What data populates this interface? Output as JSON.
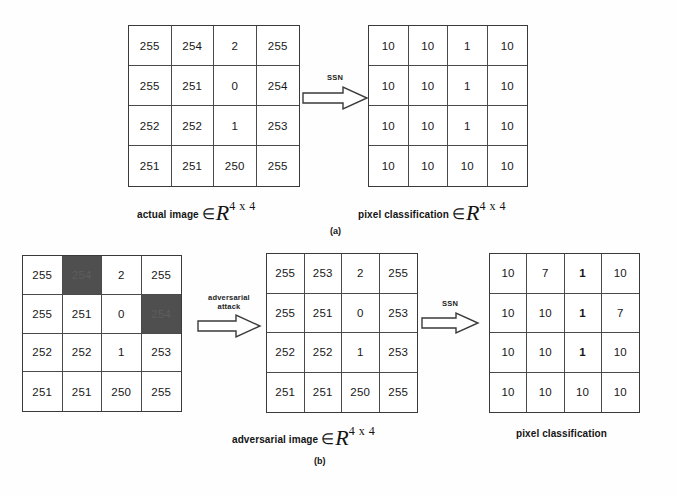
{
  "figure": {
    "panels": [
      {
        "id": "a",
        "label": "(a)",
        "left_matrix": {
          "name": "actual image",
          "rows": [
            [
              "255",
              "254",
              "2",
              "255"
            ],
            [
              "255",
              "251",
              "0",
              "254"
            ],
            [
              "252",
              "252",
              "1",
              "253"
            ],
            [
              "251",
              "251",
              "250",
              "255"
            ]
          ],
          "shaded": []
        },
        "right_matrix": {
          "name": "pixel classification",
          "rows": [
            [
              "10",
              "10",
              "1",
              "10"
            ],
            [
              "10",
              "10",
              "1",
              "10"
            ],
            [
              "10",
              "10",
              "1",
              "10"
            ],
            [
              "10",
              "10",
              "10",
              "10"
            ]
          ],
          "shaded": []
        },
        "arrow": {
          "label": "SSN"
        },
        "left_caption": {
          "text": "actual image",
          "member": "∈",
          "symbol": "R",
          "superscript": "4 x 4"
        },
        "right_caption": {
          "text": "pixel classification",
          "member": "∈",
          "symbol": "R",
          "superscript": "4 x 4"
        }
      },
      {
        "id": "b",
        "label": "(b)",
        "left_matrix": {
          "name": "original image with perturbed pixels",
          "rows": [
            [
              "255",
              "254",
              "2",
              "255"
            ],
            [
              "255",
              "251",
              "0",
              "254"
            ],
            [
              "252",
              "252",
              "1",
              "253"
            ],
            [
              "251",
              "251",
              "250",
              "255"
            ]
          ],
          "shaded": [
            "0,1",
            "1,3"
          ]
        },
        "middle_matrix": {
          "name": "adversarial image",
          "rows": [
            [
              "255",
              "253",
              "2",
              "255"
            ],
            [
              "255",
              "251",
              "0",
              "253"
            ],
            [
              "252",
              "252",
              "1",
              "253"
            ],
            [
              "251",
              "251",
              "250",
              "255"
            ]
          ],
          "shaded": []
        },
        "right_matrix": {
          "name": "pixel classification",
          "rows": [
            [
              "10",
              "7",
              "1",
              "10"
            ],
            [
              "10",
              "10",
              "1",
              "7"
            ],
            [
              "10",
              "10",
              "1",
              "10"
            ],
            [
              "10",
              "10",
              "10",
              "10"
            ]
          ],
          "shaded": [],
          "bold": [
            "0,2",
            "1,2",
            "2,2"
          ]
        },
        "arrow_1": {
          "label_line1": "adversarial",
          "label_line2": "attack"
        },
        "arrow_2": {
          "label": "SSN"
        },
        "middle_caption": {
          "text": "adversarial image",
          "member": "∈",
          "symbol": "R",
          "superscript": "4 x 4"
        },
        "right_caption": {
          "text": "pixel classification"
        }
      }
    ]
  },
  "colors": {
    "shaded_cell": "#4f4f4f",
    "border": "#3a3a3a",
    "background": "#fefefe",
    "text": "#171717"
  }
}
